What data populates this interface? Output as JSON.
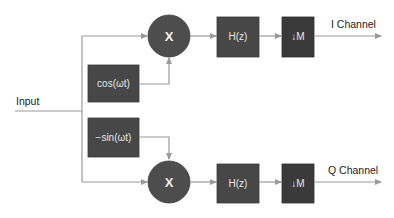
{
  "diagram": {
    "type": "IQ demodulator block diagram",
    "input_label": "Input",
    "oscillators": {
      "cos": "cos(ωt)",
      "sin": "−sin(ωt)"
    },
    "mixer_symbol": "X",
    "i_path": {
      "filter": "H(z)",
      "decimator": "↓M",
      "output_label": "I Channel"
    },
    "q_path": {
      "filter": "H(z)",
      "decimator": "↓M",
      "output_label": "Q Channel"
    },
    "colors": {
      "block_fill": "#474747",
      "decimator_fill": "#3a3a3a",
      "mixer_fill": "#4d4d4d",
      "connector": "#9a9a9a",
      "block_text": "#e6e6e6"
    }
  }
}
